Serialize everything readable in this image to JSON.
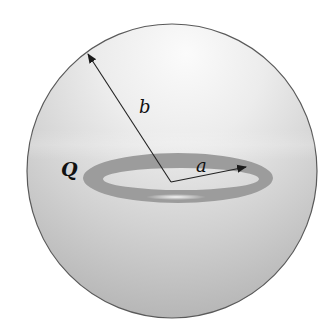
{
  "figure": {
    "type": "physics-diagram",
    "labels": {
      "charge": "Q",
      "sphere_radius": "b",
      "ring_radius": "a"
    },
    "colors": {
      "sphere_highlight": "#f7f7f7",
      "sphere_mid": "#d6d6d6",
      "sphere_shadow": "#b0b0b0",
      "sphere_outline": "#555555",
      "ring": "#9c9c9c",
      "ring_highlight": "#f2f2f2",
      "arrow": "#222222",
      "text": "#111111"
    }
  }
}
